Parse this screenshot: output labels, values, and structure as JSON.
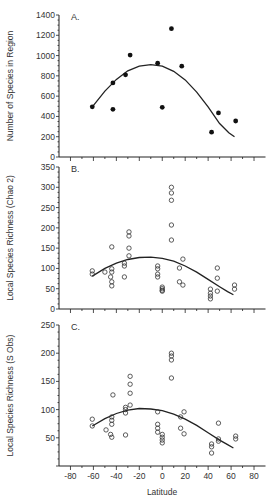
{
  "figure": {
    "xlabel": "Latitude",
    "x_ticks": [
      -80,
      -60,
      -40,
      -20,
      0,
      20,
      40,
      60,
      80
    ],
    "x_range": [
      -90,
      90
    ]
  },
  "chart_data": [
    {
      "type": "scatter",
      "panel": "A.",
      "title": "",
      "xlabel": "Latitude",
      "ylabel": "Number of Species in Region",
      "xlim": [
        -90,
        90
      ],
      "ylim": [
        0,
        1400
      ],
      "y_ticks": [
        0,
        200,
        400,
        600,
        800,
        1000,
        1200,
        1400
      ],
      "marker": "filled",
      "points": [
        [
          -61,
          495
        ],
        [
          -43,
          470
        ],
        [
          -43,
          730
        ],
        [
          -32,
          810
        ],
        [
          -28,
          1005
        ],
        [
          -4,
          925
        ],
        [
          0,
          490
        ],
        [
          8,
          1265
        ],
        [
          17,
          895
        ],
        [
          43,
          245
        ],
        [
          49,
          435
        ],
        [
          64,
          355
        ]
      ],
      "fit_curve": [
        [
          -61,
          495
        ],
        [
          -50,
          650
        ],
        [
          -40,
          765
        ],
        [
          -30,
          850
        ],
        [
          -20,
          895
        ],
        [
          -10,
          910
        ],
        [
          0,
          895
        ],
        [
          10,
          845
        ],
        [
          20,
          760
        ],
        [
          30,
          640
        ],
        [
          40,
          495
        ],
        [
          50,
          330
        ],
        [
          58,
          240
        ],
        [
          63,
          200
        ]
      ]
    },
    {
      "type": "scatter",
      "panel": "B.",
      "title": "",
      "xlabel": "Latitude",
      "ylabel": "Local Species Richness (Chao 2)",
      "xlim": [
        -90,
        90
      ],
      "ylim": [
        0,
        350
      ],
      "y_ticks": [
        0,
        50,
        100,
        150,
        200,
        250,
        300,
        350
      ],
      "marker": "open",
      "points": [
        [
          -61,
          94
        ],
        [
          -61,
          86
        ],
        [
          -50,
          91
        ],
        [
          -44,
          153
        ],
        [
          -44,
          99
        ],
        [
          -44,
          91
        ],
        [
          -45,
          79
        ],
        [
          -44,
          67
        ],
        [
          -44,
          57
        ],
        [
          -33,
          113
        ],
        [
          -33,
          106
        ],
        [
          -33,
          79
        ],
        [
          -29,
          190
        ],
        [
          -29,
          180
        ],
        [
          -29,
          150
        ],
        [
          -29,
          131
        ],
        [
          -4,
          106
        ],
        [
          -4,
          99
        ],
        [
          -4,
          86
        ],
        [
          -4,
          79
        ],
        [
          0,
          54
        ],
        [
          0,
          50
        ],
        [
          0,
          46
        ],
        [
          0,
          44
        ],
        [
          8,
          300
        ],
        [
          8,
          286
        ],
        [
          8,
          268
        ],
        [
          8,
          207
        ],
        [
          8,
          170
        ],
        [
          15,
          101
        ],
        [
          15,
          67
        ],
        [
          18,
          59
        ],
        [
          18,
          123
        ],
        [
          42,
          49
        ],
        [
          42,
          39
        ],
        [
          42,
          32
        ],
        [
          42,
          25
        ],
        [
          48,
          101
        ],
        [
          48,
          76
        ],
        [
          48,
          44
        ],
        [
          63,
          59
        ],
        [
          63,
          49
        ]
      ],
      "fit_curve": [
        [
          -61,
          81
        ],
        [
          -50,
          100
        ],
        [
          -40,
          113
        ],
        [
          -30,
          122
        ],
        [
          -20,
          127
        ],
        [
          -10,
          128
        ],
        [
          0,
          125
        ],
        [
          10,
          118
        ],
        [
          20,
          106
        ],
        [
          30,
          91
        ],
        [
          40,
          73
        ],
        [
          50,
          55
        ],
        [
          57,
          43
        ],
        [
          62,
          35
        ]
      ]
    },
    {
      "type": "scatter",
      "panel": "C.",
      "title": "",
      "xlabel": "Latitude",
      "ylabel": "Local Species Richness (S Obs)",
      "xlim": [
        -90,
        90
      ],
      "ylim": [
        0,
        250
      ],
      "y_ticks": [
        50,
        100,
        150,
        200,
        250
      ],
      "marker": "open",
      "points": [
        [
          -61,
          83
        ],
        [
          -61,
          71
        ],
        [
          -49,
          64
        ],
        [
          -43,
          126
        ],
        [
          -44,
          87
        ],
        [
          -44,
          81
        ],
        [
          -44,
          74
        ],
        [
          -45,
          56
        ],
        [
          -44,
          51
        ],
        [
          -32,
          104
        ],
        [
          -32,
          100
        ],
        [
          -32,
          94
        ],
        [
          -32,
          55
        ],
        [
          -28,
          159
        ],
        [
          -28,
          145
        ],
        [
          -28,
          129
        ],
        [
          -28,
          108
        ],
        [
          -4,
          96
        ],
        [
          -4,
          74
        ],
        [
          -4,
          67
        ],
        [
          -4,
          60
        ],
        [
          0,
          56
        ],
        [
          0,
          51
        ],
        [
          0,
          46
        ],
        [
          0,
          41
        ],
        [
          8,
          200
        ],
        [
          8,
          195
        ],
        [
          8,
          188
        ],
        [
          8,
          156
        ],
        [
          16,
          87
        ],
        [
          16,
          67
        ],
        [
          19,
          96
        ],
        [
          19,
          57
        ],
        [
          43,
          39
        ],
        [
          43,
          34
        ],
        [
          43,
          23
        ],
        [
          49,
          76
        ],
        [
          49,
          48
        ],
        [
          49,
          44
        ],
        [
          64,
          53
        ],
        [
          64,
          48
        ]
      ],
      "fit_curve": [
        [
          -61,
          71
        ],
        [
          -50,
          84
        ],
        [
          -40,
          93
        ],
        [
          -30,
          99
        ],
        [
          -20,
          102
        ],
        [
          -10,
          101
        ],
        [
          0,
          98
        ],
        [
          10,
          92
        ],
        [
          20,
          83
        ],
        [
          30,
          72
        ],
        [
          40,
          59
        ],
        [
          50,
          46
        ],
        [
          57,
          38
        ],
        [
          62,
          32
        ]
      ]
    }
  ]
}
